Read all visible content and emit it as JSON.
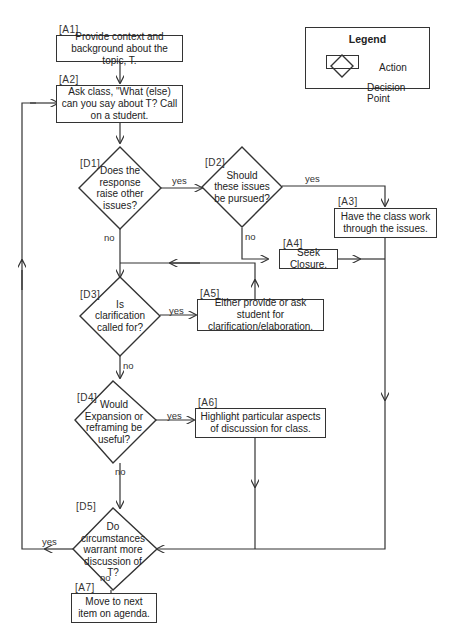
{
  "legend": {
    "title": "Legend",
    "action_label": "Action",
    "decision_label": "Decision Point"
  },
  "actions": [
    {
      "id": "A1",
      "tag": "[A1]",
      "text": "Provide context  and background about the topic, T."
    },
    {
      "id": "A2",
      "tag": "[A2]",
      "text": "Ask class, \"What (else) can you say about T? Call on a student."
    },
    {
      "id": "A3",
      "tag": "[A3]",
      "text": "Have the class work through the issues."
    },
    {
      "id": "A4",
      "tag": "[A4]",
      "text": "Seek Closure."
    },
    {
      "id": "A5",
      "tag": "[A5]",
      "text": "Either provide or ask student for clarification/elaboration."
    },
    {
      "id": "A6",
      "tag": "[A6]",
      "text": "Highlight particular aspects of discussion for class."
    },
    {
      "id": "A7",
      "tag": "[A7]",
      "text": "Move to next item on agenda."
    }
  ],
  "decisions": [
    {
      "id": "D1",
      "tag": "[D1]",
      "text": "Does the response raise other issues?"
    },
    {
      "id": "D2",
      "tag": "[D2]",
      "text": "Should these issues be pursued?"
    },
    {
      "id": "D3",
      "tag": "[D3]",
      "text": "Is clarification called for?"
    },
    {
      "id": "D4",
      "tag": "[D4]",
      "text": "Would Expansion or reframing be useful?"
    },
    {
      "id": "D5",
      "tag": "[D5]",
      "text": "Do circumstances warrant more discussion of T?"
    }
  ],
  "edge_labels": {
    "d1_yes": "yes",
    "d1_no": "no",
    "d2_yes": "yes",
    "d2_no": "no",
    "d3_yes": "yes",
    "d3_no": "no",
    "d4_yes": "yes",
    "d4_no": "no",
    "d5_yes": "yes",
    "d5_no": "no"
  },
  "colors": {
    "line": "#333333",
    "background": "#ffffff"
  }
}
